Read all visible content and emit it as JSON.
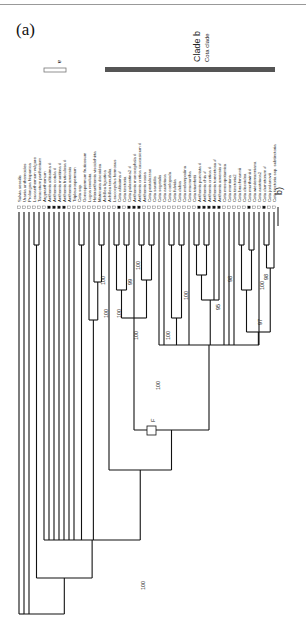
{
  "figure": {
    "panel_label": "(a)",
    "clade_a_label": "a",
    "clade_b_label": "Clade b",
    "clade_b_sublabel": "Cota clade",
    "side_label": "b)",
    "node_label_F": "F",
    "line_color": "#111111",
    "clade_bar_color": "#555555"
  },
  "tree": {
    "orientation": "rotated-90 (leaves at top, root at bottom)",
    "taxa": [
      "Salvia sessilis",
      "Urania anthemoides",
      "Prolongoa hispanica",
      "Leucanthemum vulgare",
      "Tanacetum parthenium",
      "Argyranthemum",
      "Anthemis altissima #",
      "Anthemis cotula #",
      "Anthemis maritima #",
      "Anthemis fruticulosa #",
      "Anthemis arvensis",
      "Tripleurospermum",
      "Cota ssp.",
      "Gonospermum fruticosum",
      "Lugoa revoluta",
      "Heteranthemis viscidehirta",
      "Matricaria discoidea",
      "Achillea ligustica",
      "Achillea tenuifolia",
      "Leucocyclus formosus",
      "Cota altissima #",
      "Cota tinctoria",
      "Cota palaestina2 #",
      "Anthemis monocephala #",
      "Anthemis cretica caucasicum #",
      "Anthemis rosea",
      "Cota pestalozzae",
      "Cota saxatilis",
      "Cota segetalis",
      "Cota austriaca",
      "Cota coelopoda",
      "Cota fulvida",
      "Cota dubia",
      "Cota melampodina",
      "Cota macrantha",
      "Cota triumfetti",
      "Anthemis punctata #",
      "Anthemis chia #",
      "Anthemis cretica #",
      "Anthemis tomentosa #",
      "Anthemis arvensis #",
      "Cota mesopotamica",
      "Cota montana",
      "Cota tinctoria2",
      "Cota brachmannii",
      "Cota discoidea",
      "Cota murthwinii #",
      "Cota wiedemanniana",
      "Cota austriaca2",
      "Cota dumetorum #",
      "Cota jordanovii",
      "Cota tinctoria ssp. subtinctoria"
    ],
    "bootstrap_values": [
      "100",
      "100",
      "100",
      "99",
      "100",
      "100",
      "100",
      "100",
      "95",
      "98",
      "100",
      "98",
      "97",
      "100",
      "100"
    ]
  }
}
